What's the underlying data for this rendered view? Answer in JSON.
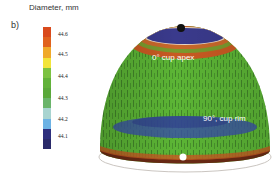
{
  "panel_label": "b)",
  "colorbar": {
    "title": "Diameter, mm",
    "ticks": [
      {
        "label": "44.6",
        "pos": 0.06
      },
      {
        "label": "44.5",
        "pos": 0.22
      },
      {
        "label": "44.4",
        "pos": 0.4
      },
      {
        "label": "44.3",
        "pos": 0.58
      },
      {
        "label": "44.2",
        "pos": 0.75
      },
      {
        "label": "44.1",
        "pos": 0.89
      }
    ],
    "colors": [
      "#d94a1c",
      "#e0621e",
      "#f0a92a",
      "#f2e43a",
      "#7cc241",
      "#62b23a",
      "#5aa83a",
      "#6ab46a",
      "#a8d4d0",
      "#6cb2e4",
      "#2e2f7e",
      "#2a2a6a"
    ]
  },
  "labels": {
    "apex": "0°  cup apex",
    "rim": "90°, cup rim"
  },
  "colors": {
    "dome_green": "#5cb535",
    "apex_blue": "#3a3a8c",
    "band_blue": "#3950a8",
    "ring_orange": "#c85a22",
    "rim_dark": "#6a2a14"
  }
}
